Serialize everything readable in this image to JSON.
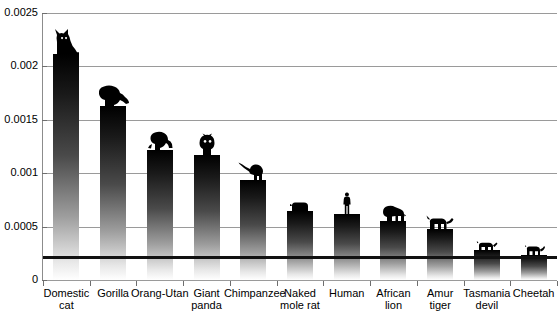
{
  "chart_data": {
    "type": "bar",
    "title": "",
    "xlabel": "",
    "ylabel": "",
    "ylim": [
      0,
      0.0025
    ],
    "grid": true,
    "legend": false,
    "y_ticks": [
      "0",
      "0.0005",
      "0.001",
      "0.0015",
      "0.002",
      "0.0025"
    ],
    "y_tick_values": [
      0,
      0.0005,
      0.001,
      0.0015,
      0.002,
      0.0025
    ],
    "categories": [
      "Domestic cat",
      "Gorilla",
      "Orang-Utan",
      "Giant panda",
      "Chimpanzee",
      "Naked mole rat",
      "Human",
      "African lion",
      "Amur tiger",
      "Tasmania devil",
      "Cheetah"
    ],
    "values": [
      0.00212,
      0.00163,
      0.00122,
      0.00117,
      0.00094,
      0.00065,
      0.00062,
      0.00055,
      0.00048,
      0.00028,
      0.00023
    ],
    "annotations": [
      {
        "name": "reference-line",
        "type": "horizontal-line",
        "value": 0.00022
      }
    ]
  },
  "axis": {
    "y_labels": [
      {
        "text": "0.0025",
        "value": 0.0025
      },
      {
        "text": "0.002",
        "value": 0.002
      },
      {
        "text": "0.0015",
        "value": 0.0015
      },
      {
        "text": "0.001",
        "value": 0.001
      },
      {
        "text": "0.0005",
        "value": 0.0005
      },
      {
        "text": "0",
        "value": 0
      }
    ]
  },
  "bars": [
    {
      "label_line1": "Domestic",
      "label_line2": "cat",
      "value": 0.00212,
      "icon": "cat-icon"
    },
    {
      "label_line1": "Gorilla",
      "label_line2": "",
      "value": 0.00163,
      "icon": "gorilla-icon"
    },
    {
      "label_line1": "Orang-Utan",
      "label_line2": "",
      "value": 0.00122,
      "icon": "orangutan-icon"
    },
    {
      "label_line1": "Giant",
      "label_line2": "panda",
      "value": 0.00117,
      "icon": "panda-icon"
    },
    {
      "label_line1": "Chimpanzee",
      "label_line2": "",
      "value": 0.00094,
      "icon": "chimpanzee-icon"
    },
    {
      "label_line1": "Naked",
      "label_line2": "mole rat",
      "value": 0.00065,
      "icon": "mole-rat-icon"
    },
    {
      "label_line1": "Human",
      "label_line2": "",
      "value": 0.00062,
      "icon": "human-icon"
    },
    {
      "label_line1": "African",
      "label_line2": "lion",
      "value": 0.00055,
      "icon": "lion-icon"
    },
    {
      "label_line1": "Amur",
      "label_line2": "tiger",
      "value": 0.00048,
      "icon": "tiger-icon"
    },
    {
      "label_line1": "Tasmania",
      "label_line2": "devil",
      "value": 0.00028,
      "icon": "tasmanian-devil-icon"
    },
    {
      "label_line1": "Cheetah",
      "label_line2": "",
      "value": 0.00023,
      "icon": "cheetah-icon"
    }
  ],
  "colors": {
    "bar_top": "#000000",
    "bar_bottom": "#ffffff",
    "gridline": "#9a9a9a",
    "axis": "#6e6e6e",
    "reference_line": "#111111",
    "background": "#ffffff",
    "text": "#000000"
  }
}
